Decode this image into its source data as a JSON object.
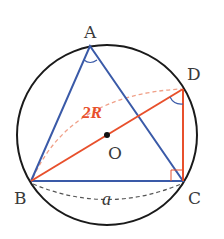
{
  "diagram": {
    "colors": {
      "circle": "#1a1a1a",
      "triangle": "#3a5aa8",
      "diameter": "#e8502c",
      "dashed_orange": "#f0a088",
      "dashed_gray": "#555555",
      "center_dot": "#111111",
      "label": "#3a3a3a"
    },
    "circle": {
      "cx": 107,
      "cy": 135,
      "r": 90
    },
    "points": {
      "A": {
        "x": 90,
        "y": 46,
        "label": "A"
      },
      "B": {
        "x": 31,
        "y": 181,
        "label": "B"
      },
      "C": {
        "x": 183,
        "y": 181,
        "label": "C"
      },
      "D": {
        "x": 183,
        "y": 89,
        "label": "D"
      },
      "O": {
        "x": 107,
        "y": 135,
        "label": "O"
      }
    },
    "labels": {
      "A": "A",
      "B": "B",
      "C": "C",
      "D": "D",
      "O": "O",
      "diameter": "2R",
      "side": "a"
    }
  }
}
